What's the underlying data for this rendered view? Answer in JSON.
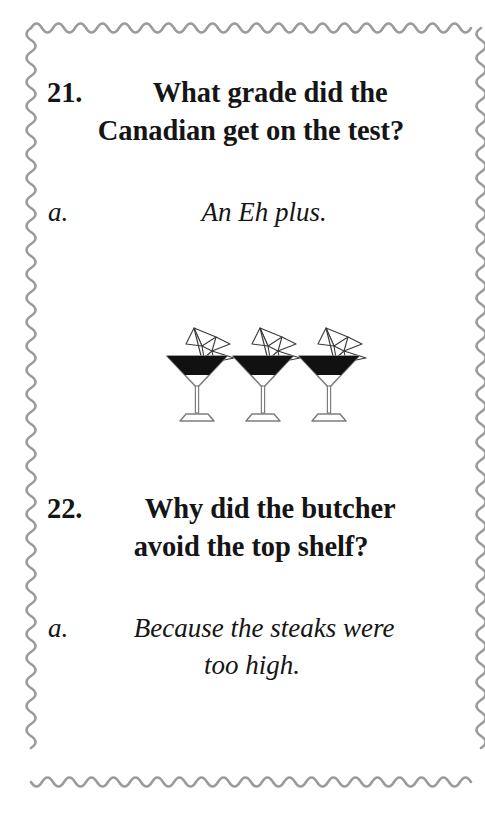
{
  "page": {
    "background_color": "#ffffff",
    "border_color": "#9b9b9b",
    "text_color": "#151515"
  },
  "items": [
    {
      "number": "21.",
      "question_line_1": "What grade did the",
      "question_line_2": "Canadian get on the test?",
      "answer_label": "a.",
      "answer_line_1": "An Eh plus.",
      "answer_line_2": ""
    },
    {
      "number": "22.",
      "question_line_1": "Why did the butcher",
      "question_line_2": "avoid the top shelf?",
      "answer_label": "a.",
      "answer_line_1": "Because the steaks were",
      "answer_line_2": "too high."
    }
  ],
  "illustration": {
    "name": "three-cocktail-glasses-with-parasols",
    "count": 3,
    "glass_type": "martini",
    "liquid_color": "#111111",
    "outline_color": "#7d7d7d"
  }
}
